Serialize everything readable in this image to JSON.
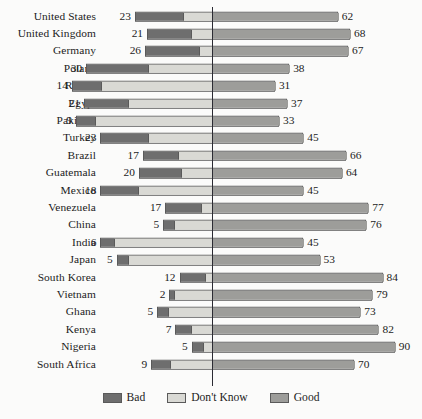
{
  "chart_data": {
    "type": "bar",
    "subtype": "diverging-stacked-bar",
    "title": "",
    "xlabel": "",
    "ylabel": "",
    "grid": false,
    "legend_position": "bottom",
    "axis_zero_line": true,
    "categories": [
      "United States",
      "United Kingdom",
      "Germany",
      "Poland",
      "Russia",
      "Egypt",
      "Pakistan",
      "Turkey",
      "Brazil",
      "Guatemala",
      "Mexico",
      "Venezuela",
      "China",
      "India",
      "Japan",
      "South Korea",
      "Vietnam",
      "Ghana",
      "Kenya",
      "Nigeria",
      "South Africa"
    ],
    "series": [
      {
        "name": "Bad",
        "color": "#6e6e6e",
        "values": [
          23,
          21,
          26,
          30,
          14,
          21,
          9,
          23,
          17,
          20,
          18,
          17,
          5,
          6,
          5,
          12,
          2,
          5,
          7,
          5,
          9
        ]
      },
      {
        "name": "Don't Know",
        "color": "#d9d9d4",
        "values": [
          15,
          11,
          7,
          32,
          55,
          42,
          58,
          32,
          17,
          16,
          37,
          6,
          19,
          49,
          42,
          4,
          19,
          22,
          11,
          5,
          21
        ]
      },
      {
        "name": "Good",
        "color": "#9d9d9a",
        "values": [
          62,
          68,
          67,
          38,
          31,
          37,
          33,
          45,
          66,
          64,
          45,
          77,
          76,
          45,
          53,
          84,
          79,
          73,
          82,
          90,
          70
        ]
      }
    ],
    "left_labels": [
      23,
      21,
      26,
      30,
      14,
      21,
      9,
      23,
      17,
      20,
      18,
      17,
      5,
      6,
      5,
      12,
      2,
      5,
      7,
      5,
      9
    ],
    "right_labels": [
      62,
      68,
      67,
      38,
      31,
      37,
      33,
      45,
      66,
      64,
      45,
      77,
      76,
      45,
      53,
      84,
      79,
      73,
      82,
      90,
      70
    ]
  },
  "legend": {
    "items": [
      {
        "label": "Bad",
        "color": "#6e6e6e"
      },
      {
        "label": "Don't Know",
        "color": "#d9d9d4"
      },
      {
        "label": "Good",
        "color": "#9d9d9a"
      }
    ]
  }
}
